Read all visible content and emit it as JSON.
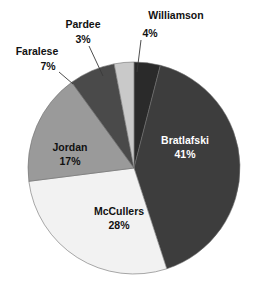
{
  "chart_data": {
    "type": "pie",
    "title": "",
    "subtitle": "",
    "xlabel": "",
    "ylabel": "",
    "legend_position": "none",
    "grid": false,
    "labels_show_percent": true,
    "total_percent": 100,
    "start_angle_deg": 0,
    "direction": "clockwise",
    "categories": [
      "Williamson",
      "Bratlafski",
      "McCullers",
      "Jordan",
      "Faralese",
      "Pardee"
    ],
    "values": [
      4,
      41,
      28,
      17,
      7,
      3
    ],
    "slices": [
      {
        "name": "Williamson",
        "label": "Williamson",
        "percent": 4,
        "percent_text": "4%",
        "color": "#2a2a2a",
        "label_placement": "outside",
        "label_text_color": "#111111",
        "label_x": 176,
        "label_y": 16,
        "percent_x": 150,
        "percent_y": 34,
        "leader_x1": 141,
        "leader_y1": 40,
        "leader_x2": 137,
        "leader_y2": 72
      },
      {
        "name": "Bratlafski",
        "label": "Bratlafski",
        "percent": 41,
        "percent_text": "41%",
        "color": "#3d3d3d",
        "label_placement": "inside",
        "label_text_color": "#ffffff",
        "label_x": 185,
        "label_y": 141,
        "percent_x": 185,
        "percent_y": 155
      },
      {
        "name": "McCullers",
        "label": "McCullers",
        "percent": 28,
        "percent_text": "28%",
        "color": "#f2f2f2",
        "label_placement": "inside",
        "label_text_color": "#111111",
        "label_x": 119,
        "label_y": 212,
        "percent_x": 119,
        "percent_y": 226
      },
      {
        "name": "Jordan",
        "label": "Jordan",
        "percent": 17,
        "percent_text": "17%",
        "color": "#9a9a9a",
        "label_placement": "inside",
        "label_text_color": "#111111",
        "label_x": 70,
        "label_y": 148,
        "percent_x": 70,
        "percent_y": 162
      },
      {
        "name": "Faralese",
        "label": "Faralese",
        "percent": 7,
        "percent_text": "7%",
        "color": "#4a4a4a",
        "label_placement": "outside",
        "label_text_color": "#111111",
        "label_x": 37,
        "label_y": 52,
        "percent_x": 48,
        "percent_y": 67,
        "leader_x1": 59,
        "leader_y1": 72,
        "leader_x2": 73,
        "leader_y2": 84
      },
      {
        "name": "Pardee",
        "label": "Pardee",
        "percent": 3,
        "percent_text": "3%",
        "color": "#c9c9c9",
        "label_placement": "outside",
        "label_text_color": "#111111",
        "label_x": 83,
        "label_y": 25,
        "percent_x": 83,
        "percent_y": 40,
        "leader_x1": 89,
        "leader_y1": 46,
        "leader_x2": 103,
        "leader_y2": 76
      }
    ],
    "geometry": {
      "center_x": 134,
      "center_y": 168,
      "radius": 106
    }
  }
}
